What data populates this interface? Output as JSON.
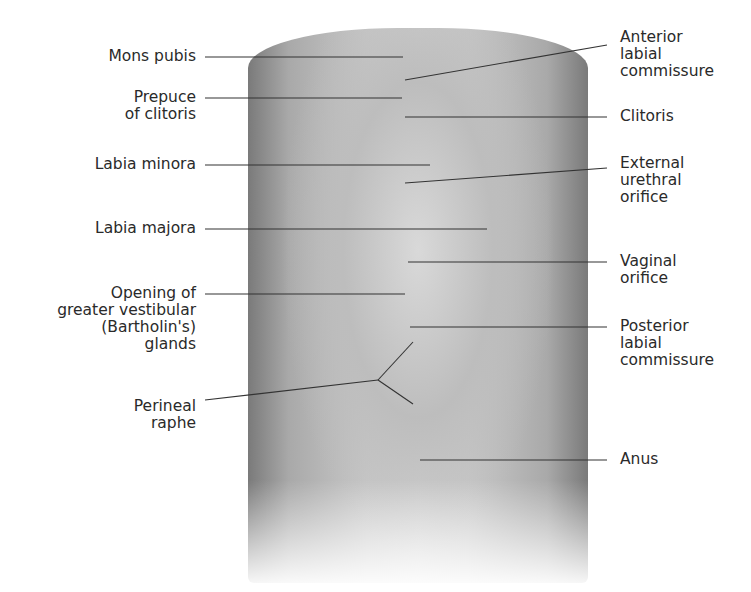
{
  "diagram": {
    "labels_left": [
      {
        "id": "mons-pubis",
        "text": "Mons pubis"
      },
      {
        "id": "prepuce-of-clitoris",
        "text": "Prepuce\nof clitoris"
      },
      {
        "id": "labia-minora",
        "text": "Labia minora"
      },
      {
        "id": "labia-majora",
        "text": "Labia majora"
      },
      {
        "id": "bartholins-glands",
        "text": "Opening of\ngreater vestibular\n(Bartholin's)\nglands"
      },
      {
        "id": "perineal-raphe",
        "text": "Perineal\nraphe"
      }
    ],
    "labels_right": [
      {
        "id": "anterior-labial-commissure",
        "text": "Anterior\nlabial\ncommissure"
      },
      {
        "id": "clitoris",
        "text": "Clitoris"
      },
      {
        "id": "external-urethral-orifice",
        "text": "External\nurethral\norifice"
      },
      {
        "id": "vaginal-orifice",
        "text": "Vaginal\norifice"
      },
      {
        "id": "posterior-labial-commissure",
        "text": "Posterior\nlabial\ncommissure"
      },
      {
        "id": "anus",
        "text": "Anus"
      }
    ]
  }
}
